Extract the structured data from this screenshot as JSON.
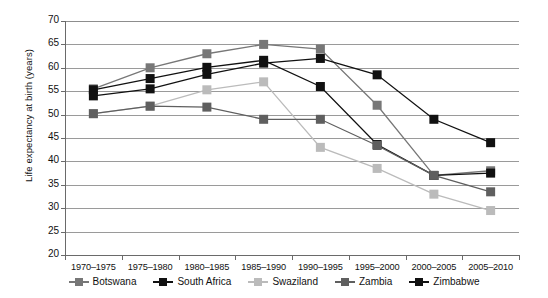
{
  "chart_data": {
    "type": "line",
    "title": "",
    "xlabel": "",
    "ylabel": "Life expectancy at birth (years)",
    "ylim": [
      20,
      70
    ],
    "ytick_step": 5,
    "yticks": [
      70,
      65,
      60,
      55,
      50,
      45,
      40,
      35,
      30,
      25,
      20
    ],
    "grid": true,
    "legend_position": "bottom",
    "categories": [
      "1970–1975",
      "1975–1980",
      "1980–1985",
      "1985–1990",
      "1990–1995",
      "1995–2000",
      "2000–2005",
      "2005–2010"
    ],
    "series": [
      {
        "name": "Botswana",
        "color": "#777777",
        "values": [
          55.5,
          60.0,
          63.0,
          65.0,
          64.0,
          52.0,
          37.0,
          38.0
        ]
      },
      {
        "name": "South Africa",
        "color": "#111111",
        "values": [
          55.3,
          57.7,
          60.1,
          61.6,
          56.0,
          43.6,
          37.0,
          37.5
        ]
      },
      {
        "name": "Swaziland",
        "color": "#bbbbbb",
        "values": [
          50.2,
          51.8,
          55.3,
          57.0,
          43.0,
          38.5,
          33.0,
          29.5
        ]
      },
      {
        "name": "Zambia",
        "color": "#5f5f5f",
        "values": [
          50.2,
          51.8,
          51.6,
          49.0,
          49.0,
          43.4,
          37.0,
          33.5
        ]
      },
      {
        "name": "Zimbabwe",
        "color": "#111111",
        "values": [
          54.0,
          55.5,
          58.6,
          61.0,
          62.0,
          58.5,
          49.0,
          44.0
        ]
      }
    ]
  },
  "axis": {
    "y_title": "Life expectancy at birth (years)"
  },
  "legend": {
    "items": [
      {
        "label": "Botswana"
      },
      {
        "label": "South Africa"
      },
      {
        "label": "Swaziland"
      },
      {
        "label": "Zambia"
      },
      {
        "label": "Zimbabwe"
      }
    ]
  }
}
